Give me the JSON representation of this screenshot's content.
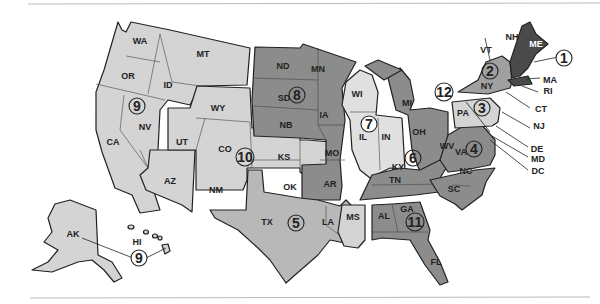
{
  "map": {
    "title_region": "United States regions map",
    "colors": {
      "light": "#d4d4d4",
      "medium": "#a8a8a8",
      "dark": "#8c8c8c",
      "darkest": "#4a4a4a",
      "border": "#222222",
      "background": "#ffffff"
    },
    "districts": [
      {
        "number": "1",
        "states": [
          "ME",
          "NH",
          "VT",
          "MA",
          "RI",
          "CT"
        ]
      },
      {
        "number": "2",
        "states": [
          "NY"
        ]
      },
      {
        "number": "3",
        "states": [
          "PA",
          "NJ"
        ]
      },
      {
        "number": "4",
        "states": [
          "WV",
          "VA",
          "NC",
          "SC",
          "MD",
          "DE",
          "DC"
        ]
      },
      {
        "number": "5",
        "states": [
          "TX",
          "LA"
        ]
      },
      {
        "number": "6",
        "states": [
          "KY",
          "TN",
          "OH",
          "MI"
        ]
      },
      {
        "number": "7",
        "states": [
          "IL",
          "IN",
          "WI"
        ]
      },
      {
        "number": "8",
        "states": [
          "ND",
          "SD",
          "NB",
          "MN",
          "IA",
          "MO",
          "AR"
        ]
      },
      {
        "number": "9",
        "states": [
          "WA",
          "OR",
          "ID",
          "MT",
          "CA",
          "NV",
          "AZ",
          "AK",
          "HI"
        ]
      },
      {
        "number": "10",
        "states": [
          "WY",
          "UT",
          "CO",
          "NM",
          "KS",
          "OK"
        ]
      },
      {
        "number": "11",
        "states": [
          "AL",
          "GA",
          "FL",
          "MS"
        ]
      },
      {
        "number": "12",
        "states": []
      }
    ],
    "state_labels": {
      "WA": "WA",
      "OR": "OR",
      "ID": "ID",
      "MT": "MT",
      "CA": "CA",
      "NV": "NV",
      "AZ": "AZ",
      "WY": "WY",
      "UT": "UT",
      "CO": "CO",
      "NM": "NM",
      "KS": "KS",
      "OK": "OK",
      "TX": "TX",
      "ND": "ND",
      "SD": "SD",
      "NB": "NB",
      "MN": "MN",
      "IA": "IA",
      "MO": "MO",
      "AR": "AR",
      "LA": "LA",
      "WI": "WI",
      "IL": "IL",
      "IN": "IN",
      "MI": "MI",
      "OH": "OH",
      "KY": "KY",
      "TN": "TN",
      "MS": "MS",
      "AL": "AL",
      "GA": "GA",
      "FL": "FL",
      "WV": "WV",
      "VA": "VA",
      "NC": "NC",
      "SC": "SC",
      "PA": "PA",
      "NY": "NY",
      "ME": "ME",
      "NH": "NH",
      "VT": "VT",
      "MA": "MA",
      "RI": "RI",
      "CT": "CT",
      "NJ": "NJ",
      "DE": "DE",
      "MD": "MD",
      "DC": "DC",
      "AK": "AK",
      "HI": "HI"
    },
    "circle_labels": {
      "d1": "1",
      "d2": "2",
      "d3": "3",
      "d4": "4",
      "d5": "5",
      "d6": "6",
      "d7": "7",
      "d8": "8",
      "d9a": "9",
      "d9b": "9",
      "d10": "10",
      "d11": "11",
      "d12": "12"
    }
  }
}
